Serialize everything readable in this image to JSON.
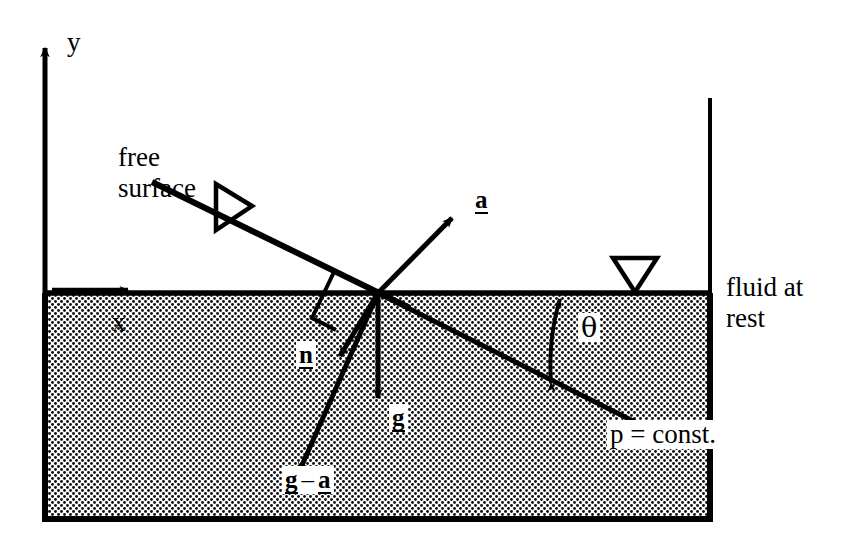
{
  "figure": {
    "type": "physics-vector-diagram"
  },
  "axes": {
    "y_label": "y",
    "x_label": "x"
  },
  "labels": {
    "free_surface_line1": "free",
    "free_surface_line2": "surface",
    "fluid_at_rest_line1": "fluid at",
    "fluid_at_rest_line2": "rest",
    "pressure_constant": "p = const.",
    "theta": "θ"
  },
  "vectors": {
    "a": "a",
    "n": "n",
    "g": "g",
    "g_minus_a_g": "g",
    "g_minus_a_minus": "–",
    "g_minus_a_a": "a"
  },
  "symbols": {
    "free_surface_marker": "triangle-right-open",
    "rest_surface_marker": "triangle-down-open",
    "right_angle_marker": "right-angle-square"
  },
  "colors": {
    "ink": "#000000",
    "background": "#ffffff",
    "fluid_fill": "#b9b9b9"
  },
  "geometry": {
    "origin": [
      378,
      293
    ],
    "surface_y": 293,
    "left_wall_x": 45,
    "right_wall_x": 710,
    "bottom_y": 520
  }
}
